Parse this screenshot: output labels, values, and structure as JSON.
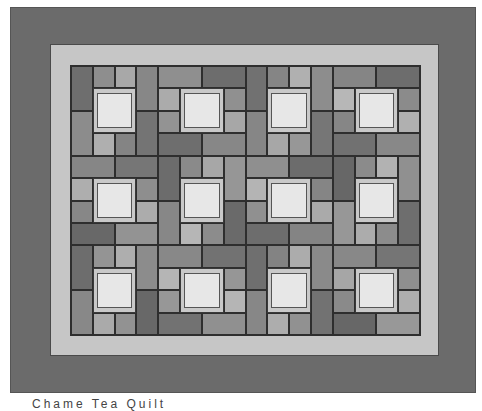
{
  "caption": "Chame  Tea  Quilt",
  "colors": {
    "outer_border": "#6b6b6b",
    "inner_border": "#c6c6c6",
    "center_frame": "#c9c9c9",
    "center_fill": "#e7e7e7",
    "dark": "#6e6e6e",
    "mid": "#8c8c8c",
    "light": "#afafaf"
  },
  "grid": {
    "cols": 16,
    "rows": 12
  },
  "patches": [
    {
      "c": 0,
      "r": 0,
      "w": 1,
      "h": 2,
      "t": "dark"
    },
    {
      "c": 1,
      "r": 0,
      "w": 1,
      "h": 1,
      "t": "mid"
    },
    {
      "c": 2,
      "r": 0,
      "w": 1,
      "h": 1,
      "t": "light"
    },
    {
      "c": 3,
      "r": 0,
      "w": 1,
      "h": 2,
      "t": "mid"
    },
    {
      "c": 0,
      "r": 2,
      "w": 1,
      "h": 2,
      "t": "mid"
    },
    {
      "c": 1,
      "r": 3,
      "w": 1,
      "h": 1,
      "t": "light"
    },
    {
      "c": 2,
      "r": 3,
      "w": 1,
      "h": 1,
      "t": "mid"
    },
    {
      "c": 3,
      "r": 2,
      "w": 1,
      "h": 2,
      "t": "dark"
    },
    {
      "c": 4,
      "r": 0,
      "w": 2,
      "h": 1,
      "t": "mid"
    },
    {
      "c": 6,
      "r": 0,
      "w": 2,
      "h": 1,
      "t": "dark"
    },
    {
      "c": 4,
      "r": 1,
      "w": 1,
      "h": 1,
      "t": "light"
    },
    {
      "c": 4,
      "r": 2,
      "w": 1,
      "h": 1,
      "t": "mid"
    },
    {
      "c": 7,
      "r": 1,
      "w": 1,
      "h": 1,
      "t": "mid"
    },
    {
      "c": 7,
      "r": 2,
      "w": 1,
      "h": 1,
      "t": "light"
    },
    {
      "c": 4,
      "r": 3,
      "w": 2,
      "h": 1,
      "t": "dark"
    },
    {
      "c": 6,
      "r": 3,
      "w": 2,
      "h": 1,
      "t": "mid"
    },
    {
      "c": 8,
      "r": 0,
      "w": 1,
      "h": 2,
      "t": "dark"
    },
    {
      "c": 9,
      "r": 0,
      "w": 1,
      "h": 1,
      "t": "mid"
    },
    {
      "c": 10,
      "r": 0,
      "w": 1,
      "h": 1,
      "t": "light"
    },
    {
      "c": 11,
      "r": 0,
      "w": 1,
      "h": 2,
      "t": "mid"
    },
    {
      "c": 8,
      "r": 2,
      "w": 1,
      "h": 2,
      "t": "mid"
    },
    {
      "c": 9,
      "r": 3,
      "w": 1,
      "h": 1,
      "t": "light"
    },
    {
      "c": 10,
      "r": 3,
      "w": 1,
      "h": 1,
      "t": "mid"
    },
    {
      "c": 11,
      "r": 2,
      "w": 1,
      "h": 2,
      "t": "dark"
    },
    {
      "c": 12,
      "r": 0,
      "w": 2,
      "h": 1,
      "t": "mid"
    },
    {
      "c": 14,
      "r": 0,
      "w": 2,
      "h": 1,
      "t": "dark"
    },
    {
      "c": 12,
      "r": 1,
      "w": 1,
      "h": 1,
      "t": "light"
    },
    {
      "c": 12,
      "r": 2,
      "w": 1,
      "h": 1,
      "t": "mid"
    },
    {
      "c": 15,
      "r": 1,
      "w": 1,
      "h": 1,
      "t": "mid"
    },
    {
      "c": 15,
      "r": 2,
      "w": 1,
      "h": 1,
      "t": "light"
    },
    {
      "c": 12,
      "r": 3,
      "w": 2,
      "h": 1,
      "t": "dark"
    },
    {
      "c": 14,
      "r": 3,
      "w": 2,
      "h": 1,
      "t": "mid"
    },
    {
      "c": 0,
      "r": 4,
      "w": 2,
      "h": 1,
      "t": "mid"
    },
    {
      "c": 2,
      "r": 4,
      "w": 2,
      "h": 1,
      "t": "dark"
    },
    {
      "c": 0,
      "r": 5,
      "w": 1,
      "h": 1,
      "t": "light"
    },
    {
      "c": 0,
      "r": 6,
      "w": 1,
      "h": 1,
      "t": "mid"
    },
    {
      "c": 3,
      "r": 5,
      "w": 1,
      "h": 1,
      "t": "mid"
    },
    {
      "c": 3,
      "r": 6,
      "w": 1,
      "h": 1,
      "t": "light"
    },
    {
      "c": 0,
      "r": 7,
      "w": 2,
      "h": 1,
      "t": "dark"
    },
    {
      "c": 2,
      "r": 7,
      "w": 2,
      "h": 1,
      "t": "mid"
    },
    {
      "c": 4,
      "r": 4,
      "w": 1,
      "h": 2,
      "t": "dark"
    },
    {
      "c": 5,
      "r": 4,
      "w": 1,
      "h": 1,
      "t": "mid"
    },
    {
      "c": 6,
      "r": 4,
      "w": 1,
      "h": 1,
      "t": "light"
    },
    {
      "c": 7,
      "r": 4,
      "w": 1,
      "h": 2,
      "t": "mid"
    },
    {
      "c": 4,
      "r": 6,
      "w": 1,
      "h": 2,
      "t": "mid"
    },
    {
      "c": 5,
      "r": 7,
      "w": 1,
      "h": 1,
      "t": "light"
    },
    {
      "c": 6,
      "r": 7,
      "w": 1,
      "h": 1,
      "t": "mid"
    },
    {
      "c": 7,
      "r": 6,
      "w": 1,
      "h": 2,
      "t": "dark"
    },
    {
      "c": 8,
      "r": 4,
      "w": 2,
      "h": 1,
      "t": "mid"
    },
    {
      "c": 10,
      "r": 4,
      "w": 2,
      "h": 1,
      "t": "dark"
    },
    {
      "c": 8,
      "r": 5,
      "w": 1,
      "h": 1,
      "t": "light"
    },
    {
      "c": 8,
      "r": 6,
      "w": 1,
      "h": 1,
      "t": "mid"
    },
    {
      "c": 11,
      "r": 5,
      "w": 1,
      "h": 1,
      "t": "mid"
    },
    {
      "c": 11,
      "r": 6,
      "w": 1,
      "h": 1,
      "t": "light"
    },
    {
      "c": 8,
      "r": 7,
      "w": 2,
      "h": 1,
      "t": "dark"
    },
    {
      "c": 10,
      "r": 7,
      "w": 2,
      "h": 1,
      "t": "mid"
    },
    {
      "c": 12,
      "r": 4,
      "w": 1,
      "h": 2,
      "t": "dark"
    },
    {
      "c": 13,
      "r": 4,
      "w": 1,
      "h": 1,
      "t": "mid"
    },
    {
      "c": 14,
      "r": 4,
      "w": 1,
      "h": 1,
      "t": "light"
    },
    {
      "c": 15,
      "r": 4,
      "w": 1,
      "h": 2,
      "t": "mid"
    },
    {
      "c": 12,
      "r": 6,
      "w": 1,
      "h": 2,
      "t": "mid"
    },
    {
      "c": 13,
      "r": 7,
      "w": 1,
      "h": 1,
      "t": "light"
    },
    {
      "c": 14,
      "r": 7,
      "w": 1,
      "h": 1,
      "t": "mid"
    },
    {
      "c": 15,
      "r": 6,
      "w": 1,
      "h": 2,
      "t": "dark"
    },
    {
      "c": 0,
      "r": 8,
      "w": 1,
      "h": 2,
      "t": "dark"
    },
    {
      "c": 1,
      "r": 8,
      "w": 1,
      "h": 1,
      "t": "mid"
    },
    {
      "c": 2,
      "r": 8,
      "w": 1,
      "h": 1,
      "t": "light"
    },
    {
      "c": 3,
      "r": 8,
      "w": 1,
      "h": 2,
      "t": "mid"
    },
    {
      "c": 0,
      "r": 10,
      "w": 1,
      "h": 2,
      "t": "mid"
    },
    {
      "c": 1,
      "r": 11,
      "w": 1,
      "h": 1,
      "t": "light"
    },
    {
      "c": 2,
      "r": 11,
      "w": 1,
      "h": 1,
      "t": "mid"
    },
    {
      "c": 3,
      "r": 10,
      "w": 1,
      "h": 2,
      "t": "dark"
    },
    {
      "c": 4,
      "r": 8,
      "w": 2,
      "h": 1,
      "t": "mid"
    },
    {
      "c": 6,
      "r": 8,
      "w": 2,
      "h": 1,
      "t": "dark"
    },
    {
      "c": 4,
      "r": 9,
      "w": 1,
      "h": 1,
      "t": "light"
    },
    {
      "c": 4,
      "r": 10,
      "w": 1,
      "h": 1,
      "t": "mid"
    },
    {
      "c": 7,
      "r": 9,
      "w": 1,
      "h": 1,
      "t": "mid"
    },
    {
      "c": 7,
      "r": 10,
      "w": 1,
      "h": 1,
      "t": "light"
    },
    {
      "c": 4,
      "r": 11,
      "w": 2,
      "h": 1,
      "t": "dark"
    },
    {
      "c": 6,
      "r": 11,
      "w": 2,
      "h": 1,
      "t": "mid"
    },
    {
      "c": 8,
      "r": 8,
      "w": 1,
      "h": 2,
      "t": "dark"
    },
    {
      "c": 9,
      "r": 8,
      "w": 1,
      "h": 1,
      "t": "mid"
    },
    {
      "c": 10,
      "r": 8,
      "w": 1,
      "h": 1,
      "t": "light"
    },
    {
      "c": 11,
      "r": 8,
      "w": 1,
      "h": 2,
      "t": "mid"
    },
    {
      "c": 8,
      "r": 10,
      "w": 1,
      "h": 2,
      "t": "mid"
    },
    {
      "c": 9,
      "r": 11,
      "w": 1,
      "h": 1,
      "t": "light"
    },
    {
      "c": 10,
      "r": 11,
      "w": 1,
      "h": 1,
      "t": "mid"
    },
    {
      "c": 11,
      "r": 10,
      "w": 1,
      "h": 2,
      "t": "dark"
    },
    {
      "c": 12,
      "r": 8,
      "w": 2,
      "h": 1,
      "t": "mid"
    },
    {
      "c": 14,
      "r": 8,
      "w": 2,
      "h": 1,
      "t": "dark"
    },
    {
      "c": 12,
      "r": 9,
      "w": 1,
      "h": 1,
      "t": "light"
    },
    {
      "c": 12,
      "r": 10,
      "w": 1,
      "h": 1,
      "t": "mid"
    },
    {
      "c": 15,
      "r": 9,
      "w": 1,
      "h": 1,
      "t": "mid"
    },
    {
      "c": 15,
      "r": 10,
      "w": 1,
      "h": 1,
      "t": "light"
    },
    {
      "c": 12,
      "r": 11,
      "w": 2,
      "h": 1,
      "t": "dark"
    },
    {
      "c": 14,
      "r": 11,
      "w": 2,
      "h": 1,
      "t": "mid"
    }
  ],
  "centers": [
    {
      "c": 1,
      "r": 1
    },
    {
      "c": 5,
      "r": 1
    },
    {
      "c": 9,
      "r": 1
    },
    {
      "c": 13,
      "r": 1
    },
    {
      "c": 1,
      "r": 5
    },
    {
      "c": 5,
      "r": 5
    },
    {
      "c": 9,
      "r": 5
    },
    {
      "c": 13,
      "r": 5
    },
    {
      "c": 1,
      "r": 9
    },
    {
      "c": 5,
      "r": 9
    },
    {
      "c": 9,
      "r": 9
    },
    {
      "c": 13,
      "r": 9
    }
  ]
}
